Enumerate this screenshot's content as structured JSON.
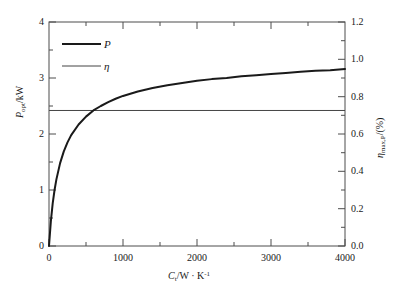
{
  "figure": {
    "background_color": "#ffffff",
    "width": 397,
    "height": 296
  },
  "chart_data": {
    "type": "line",
    "title": "",
    "subtitle": "",
    "xlabel": "C_t/W · K⁻¹",
    "xlabel_parts": {
      "symbol": "C",
      "subscript": "t",
      "unit": "/W · K",
      "unit_exponent": "-1"
    },
    "ylabel_left": "P_opt/kW",
    "ylabel_left_parts": {
      "symbol": "P",
      "subscript": "opt",
      "unit": "/kW"
    },
    "ylabel_right": "η_max,P/(%)",
    "ylabel_right_parts": {
      "symbol": "η",
      "subscript": "max,P",
      "unit": "/(%)"
    },
    "xlim": [
      0,
      4000
    ],
    "ylim_left": [
      0,
      4
    ],
    "ylim_right": [
      0.0,
      1.2
    ],
    "xticks": [
      0,
      1000,
      2000,
      3000,
      4000
    ],
    "xtick_labels": [
      "0",
      "1000",
      "2000",
      "3000",
      "4000"
    ],
    "xticks_minor": [
      500,
      1500,
      2500,
      3500
    ],
    "yticks_left": [
      0,
      1,
      2,
      3,
      4
    ],
    "ytick_labels_left": [
      "0",
      "1",
      "2",
      "3",
      "4"
    ],
    "yticks_left_minor": [
      0.5,
      1.5,
      2.5,
      3.5
    ],
    "yticks_right": [
      0.0,
      0.2,
      0.4,
      0.6,
      0.8,
      1.0,
      1.2
    ],
    "ytick_labels_right": [
      "0.0",
      "0.2",
      "0.4",
      "0.6",
      "0.8",
      "1.0",
      "1.2"
    ],
    "yticks_right_minor": [
      0.1,
      0.3,
      0.5,
      0.7,
      0.9,
      1.1
    ],
    "grid": false,
    "legend_position": "upper-left",
    "series": [
      {
        "name": "P",
        "axis": "left",
        "style": "solid",
        "line_width": 2.0,
        "color": "#1a1a1a",
        "x": [
          0,
          25,
          50,
          75,
          100,
          150,
          200,
          250,
          300,
          400,
          500,
          600,
          700,
          800,
          900,
          1000,
          1200,
          1400,
          1600,
          1800,
          2000,
          2200,
          2400,
          2600,
          2800,
          3000,
          3200,
          3400,
          3600,
          3800,
          4000
        ],
        "values": [
          0.0,
          0.44,
          0.76,
          1.0,
          1.19,
          1.48,
          1.69,
          1.85,
          1.98,
          2.17,
          2.31,
          2.42,
          2.5,
          2.57,
          2.63,
          2.68,
          2.76,
          2.82,
          2.87,
          2.91,
          2.95,
          2.98,
          3.0,
          3.03,
          3.05,
          3.07,
          3.09,
          3.11,
          3.13,
          3.14,
          3.16
        ]
      },
      {
        "name": "η",
        "axis": "right",
        "style": "solid",
        "line_width": 1.0,
        "color": "#444444",
        "constant_value_right_axis": 0.726,
        "constant_value_left_axis_equiv": 2.42,
        "x": [
          0,
          4000
        ],
        "values": [
          0.726,
          0.726
        ]
      }
    ],
    "annotations": [],
    "crossing_point": {
      "x": 870,
      "y_left": 2.42
    }
  },
  "legend": {
    "entries": [
      {
        "label": "P",
        "series": "P",
        "line_width": 2.0
      },
      {
        "label": "η",
        "series": "η",
        "line_width": 1.0
      }
    ]
  },
  "axes_style": {
    "frame_color": "#4d4d4d",
    "frame_width": 1.0,
    "tick_direction": "in",
    "tick_color": "#4d4d4d"
  }
}
